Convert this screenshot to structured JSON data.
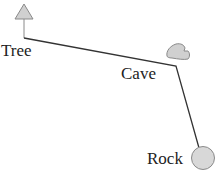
{
  "diagram": {
    "type": "path-map",
    "nodes": [
      {
        "id": "tree",
        "label": "Tree",
        "icon": "triangle-tree-icon"
      },
      {
        "id": "cave",
        "label": "Cave",
        "icon": "cave-blob-icon"
      },
      {
        "id": "rock",
        "label": "Rock",
        "icon": "circle-rock-icon"
      }
    ],
    "edges": [
      {
        "from": "tree",
        "to": "cave"
      },
      {
        "from": "cave",
        "to": "rock"
      }
    ],
    "colors": {
      "line": "#333333",
      "icon_fill": "#d0d0d0",
      "icon_stroke": "#8a8a8a",
      "text": "#222222"
    }
  }
}
